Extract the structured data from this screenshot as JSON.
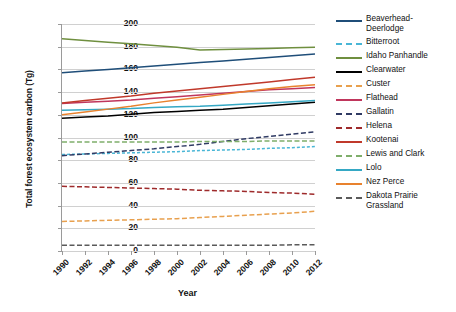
{
  "chart_data": {
    "type": "line",
    "title": "",
    "xlabel": "Year",
    "ylabel": "Total forest ecosystem carbon (Tg)",
    "ylim": [
      0,
      200
    ],
    "ytick_values": [
      0,
      20,
      40,
      60,
      80,
      100,
      120,
      140,
      160,
      180,
      200
    ],
    "grid": true,
    "legend_position": "right",
    "x": [
      1990,
      1992,
      1994,
      1996,
      1998,
      2000,
      2002,
      2004,
      2006,
      2008,
      2010,
      2012
    ],
    "xtick_labels": [
      "1990",
      "1992",
      "1994",
      "1996",
      "1998",
      "2000",
      "2002",
      "2004",
      "2006",
      "2008",
      "2010",
      "2012"
    ],
    "series": [
      {
        "name": "Beaverhead-Deerlodge",
        "label": "Beaverhead-\nDeerlodge",
        "color": "#1f4e79",
        "style": "solid",
        "values": [
          157,
          158.5,
          160,
          161.5,
          163,
          164.5,
          166,
          167.5,
          169,
          170.5,
          172,
          173.5
        ]
      },
      {
        "name": "Bitterroot",
        "label": "Bitterroot",
        "color": "#49b6d6",
        "style": "dotted",
        "values": [
          85,
          85.5,
          86,
          86.5,
          87,
          87.5,
          88.5,
          89,
          89.5,
          90.5,
          91,
          92
        ]
      },
      {
        "name": "Idaho Panhandle",
        "label": "Idaho Panhandle",
        "color": "#6f8f3f",
        "style": "solid",
        "values": [
          187,
          185.5,
          184,
          182.5,
          181,
          179.5,
          177,
          177.5,
          178,
          178.5,
          179,
          179.5
        ]
      },
      {
        "name": "Clearwater",
        "label": "Clearwater",
        "color": "#000000",
        "style": "solid",
        "values": [
          117,
          118,
          119,
          120.5,
          122,
          123,
          124,
          125,
          126.5,
          128,
          129.5,
          131
        ]
      },
      {
        "name": "Custer",
        "label": "Custer",
        "color": "#e8a04e",
        "style": "dashed",
        "values": [
          26,
          26.5,
          27,
          27.5,
          28,
          28.5,
          29.5,
          30.5,
          31.5,
          32.5,
          33.5,
          35
        ]
      },
      {
        "name": "Flathead",
        "label": "Flathead",
        "color": "#c0365c",
        "style": "solid",
        "values": [
          130,
          131,
          132,
          133,
          134.5,
          136,
          137.5,
          139,
          140.5,
          142,
          143,
          144
        ]
      },
      {
        "name": "Gallatin",
        "label": "Gallatin",
        "color": "#2f3a63",
        "style": "dashed",
        "values": [
          84,
          85.5,
          87,
          88.5,
          90,
          92,
          94,
          96.5,
          99,
          101,
          103,
          105
        ]
      },
      {
        "name": "Helena",
        "label": "Helena",
        "color": "#9e2a2b",
        "style": "dashed",
        "values": [
          57,
          56.5,
          56,
          55.5,
          55,
          54.5,
          53.5,
          53,
          52.5,
          51.5,
          51,
          50
        ]
      },
      {
        "name": "Kootenai",
        "label": "Kootenai",
        "color": "#c0392b",
        "style": "solid",
        "values": [
          130.5,
          132.5,
          134.5,
          136.5,
          139,
          141,
          143,
          145,
          147,
          149,
          151,
          153
        ]
      },
      {
        "name": "Lewis and Clark",
        "label": "Lewis and Clark",
        "color": "#7fae6b",
        "style": "dashed",
        "values": [
          96,
          96,
          96,
          96,
          96,
          96,
          96.5,
          96.5,
          96.5,
          97,
          97,
          97
        ]
      },
      {
        "name": "Lolo",
        "label": "Lolo",
        "color": "#35a8c4",
        "style": "solid",
        "values": [
          124,
          124.5,
          125,
          125.5,
          126.5,
          127,
          127.5,
          128.5,
          129.5,
          130.5,
          131.5,
          132.5
        ]
      },
      {
        "name": "Nez Perce",
        "label": "Nez Perce",
        "color": "#e8822e",
        "style": "solid",
        "values": [
          120,
          122.5,
          125,
          127.5,
          130.5,
          133,
          135.5,
          138,
          140.5,
          143,
          145,
          146.5
        ]
      },
      {
        "name": "Dakota Prairie Grassland",
        "label": "Dakota Prairie\nGrassland",
        "color": "#5a5a5a",
        "style": "dashed",
        "values": [
          5,
          5,
          5,
          5,
          5,
          5,
          5,
          5,
          5,
          5,
          5.5,
          5.5
        ]
      }
    ]
  }
}
